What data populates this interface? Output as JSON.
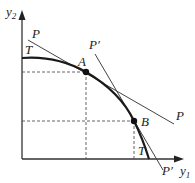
{
  "diagram": {
    "type": "production-possibility-frontier",
    "axes": {
      "y_label": "y",
      "y_subscript": "2",
      "x_label": "y",
      "x_subscript": "1"
    },
    "curve": {
      "label_top": "T",
      "label_bottom": "T"
    },
    "points": [
      {
        "name": "A",
        "label": "A"
      },
      {
        "name": "B",
        "label": "B"
      }
    ],
    "tangent_lines": [
      {
        "name": "P",
        "label_start": "P",
        "label_end": "P"
      },
      {
        "name": "P-prime",
        "label_start": "P′",
        "label_end": "P′"
      }
    ],
    "colors": {
      "curve": "#1a1a1a",
      "lines": "#444444",
      "axes": "#333333",
      "dashed": "#555555"
    }
  }
}
